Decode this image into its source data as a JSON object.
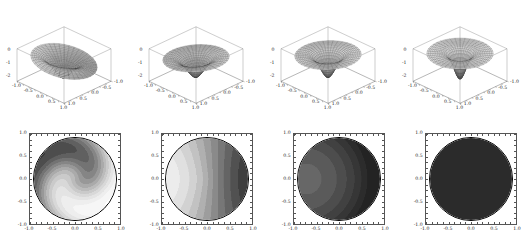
{
  "figure": {
    "background": "#ffffff",
    "rows": 2,
    "columns": 4
  },
  "axes": {
    "x_ticks": [
      "-1.0",
      "-0.5",
      "0.0",
      "0.5",
      "1.0"
    ],
    "y_ticks": [
      "1.0",
      "0.5",
      "0.0",
      "-0.5",
      "-1.0"
    ],
    "z_ticks": [
      "0",
      "-1",
      "-2"
    ],
    "x_range": [
      -1.0,
      1.0
    ],
    "y_range": [
      -1.0,
      1.0
    ],
    "z_range": [
      -2.0,
      0.0
    ]
  },
  "chart_data": [
    {
      "type": "heatmap",
      "panel": "surface-1",
      "row": "3d",
      "title": "",
      "xlabel": "",
      "ylabel": "",
      "zlabel": "",
      "xlim": [
        -1.0,
        1.0
      ],
      "ylim": [
        -1.0,
        1.0
      ],
      "zlim": [
        -2.0,
        0.0
      ],
      "x_ticks": [
        "-1.0",
        "-0.5",
        "0.0",
        "0.5",
        "1.0"
      ],
      "y_ticks": [
        "-1.0",
        "-0.5",
        "0.0",
        "0.5",
        "1.0"
      ],
      "z_ticks": [
        "0",
        "-1",
        "-2"
      ],
      "grid": true,
      "legend": "none",
      "shape": "twisted saddle with S-shaped ridge and valley, deep central depression",
      "radial_symmetry": false,
      "mesh": {
        "radial_lines": 36,
        "circular_lines": 20
      }
    },
    {
      "type": "heatmap",
      "panel": "surface-2",
      "row": "3d",
      "title": "",
      "xlabel": "",
      "ylabel": "",
      "zlabel": "",
      "xlim": [
        -1.0,
        1.0
      ],
      "ylim": [
        -1.0,
        1.0
      ],
      "zlim": [
        -2.0,
        0.0
      ],
      "x_ticks": [
        "-1.0",
        "-0.5",
        "0.0",
        "0.5",
        "1.0"
      ],
      "y_ticks": [
        "-1.0",
        "-0.5",
        "0.0",
        "0.5",
        "1.0"
      ],
      "z_ticks": [
        "0",
        "-1",
        "-2"
      ],
      "grid": true,
      "legend": "none",
      "shape": "shallow funnel with single off-centre cusp, mild azimuthal variation",
      "radial_symmetry": false,
      "mesh": {
        "radial_lines": 36,
        "circular_lines": 20
      }
    },
    {
      "type": "heatmap",
      "panel": "surface-3",
      "row": "3d",
      "title": "",
      "xlabel": "",
      "ylabel": "",
      "zlabel": "",
      "xlim": [
        -1.0,
        1.0
      ],
      "ylim": [
        -1.0,
        1.0
      ],
      "zlim": [
        -2.0,
        0.0
      ],
      "x_ticks": [
        "-1.0",
        "-0.5",
        "0.0",
        "0.5",
        "1.0"
      ],
      "y_ticks": [
        "-1.0",
        "-0.5",
        "0.0",
        "0.5",
        "1.0"
      ],
      "z_ticks": [
        "0",
        "-1",
        "-2"
      ],
      "grid": true,
      "legend": "none",
      "shape": "near radially symmetric flat disk with sharp central singular point",
      "radial_symmetry": true,
      "mesh": {
        "radial_lines": 36,
        "circular_lines": 20
      }
    },
    {
      "type": "heatmap",
      "panel": "surface-4",
      "row": "3d",
      "title": "",
      "xlabel": "",
      "ylabel": "",
      "zlabel": "",
      "xlim": [
        -1.0,
        1.0
      ],
      "ylim": [
        -1.0,
        1.0
      ],
      "zlim": [
        -2.0,
        0.0
      ],
      "x_ticks": [
        "-1.0",
        "-0.5",
        "0.0",
        "0.5",
        "1.0"
      ],
      "y_ticks": [
        "-1.0",
        "-0.5",
        "0.0",
        "0.5",
        "1.0"
      ],
      "z_ticks": [
        "0",
        "-1",
        "-2"
      ],
      "grid": true,
      "legend": "none",
      "shape": "flat radially symmetric disk with pronounced dark central spike",
      "radial_symmetry": true,
      "mesh": {
        "radial_lines": 36,
        "circular_lines": 20
      }
    },
    {
      "type": "heatmap",
      "panel": "contour-1",
      "row": "contour",
      "title": "",
      "xlabel": "",
      "ylabel": "",
      "xlim": [
        -1.0,
        1.0
      ],
      "ylim": [
        -1.0,
        1.0
      ],
      "x_ticks": [
        "-1.0",
        "-0.5",
        "0.0",
        "0.5",
        "1.0"
      ],
      "y_ticks": [
        "-1.0",
        "-0.5",
        "0.0",
        "0.5",
        "1.0"
      ],
      "grid": false,
      "legend": "none",
      "colormap": "grayscale",
      "contrast": "high",
      "pattern": "S-shaped bright band separating two dark lobes (upper-right and lower-left)",
      "levels": 14,
      "level_grays": [
        "#3a3a3a",
        "#4d4d4d",
        "#606060",
        "#737373",
        "#858585",
        "#989898",
        "#aaaaaa",
        "#bbbbbb",
        "#cacaca",
        "#d8d8d8",
        "#e4e4e4",
        "#eeeeee",
        "#f6f6f6",
        "#ffffff"
      ]
    },
    {
      "type": "heatmap",
      "panel": "contour-2",
      "row": "contour",
      "title": "",
      "xlabel": "",
      "ylabel": "",
      "xlim": [
        -1.0,
        1.0
      ],
      "ylim": [
        -1.0,
        1.0
      ],
      "x_ticks": [
        "-1.0",
        "-0.5",
        "0.0",
        "0.5",
        "1.0"
      ],
      "y_ticks": [
        "-1.0",
        "-0.5",
        "0.0",
        "0.5",
        "1.0"
      ],
      "grid": false,
      "legend": "none",
      "colormap": "grayscale",
      "contrast": "medium",
      "pattern": "left-to-right gradient, dark at left rim rising to white plateau right of centre",
      "levels": 14,
      "level_grays": [
        "#2e2e2e",
        "#3f3f3f",
        "#515151",
        "#646464",
        "#777777",
        "#8a8a8a",
        "#9d9d9d",
        "#b0b0b0",
        "#c2c2c2",
        "#d2d2d2",
        "#e0e0e0",
        "#ececec",
        "#f7f7f7",
        "#ffffff"
      ]
    },
    {
      "type": "heatmap",
      "panel": "contour-3",
      "row": "contour",
      "title": "",
      "xlabel": "",
      "ylabel": "",
      "xlim": [
        -1.0,
        1.0
      ],
      "ylim": [
        -1.0,
        1.0
      ],
      "x_ticks": [
        "-1.0",
        "-0.5",
        "0.0",
        "0.5",
        "1.0"
      ],
      "y_ticks": [
        "-1.0",
        "-0.5",
        "0.0",
        "0.5",
        "1.0"
      ],
      "grid": false,
      "legend": "none",
      "colormap": "grayscale",
      "contrast": "low",
      "pattern": "mostly dark disk with small light-gray elongated core right of centre",
      "levels": 12,
      "level_grays": [
        "#232323",
        "#2c2c2c",
        "#363636",
        "#414141",
        "#4d4d4d",
        "#5a5a5a",
        "#676767",
        "#757575",
        "#848484",
        "#959595",
        "#a6a6a6",
        "#b9b9b9"
      ]
    },
    {
      "type": "heatmap",
      "panel": "contour-4",
      "row": "contour",
      "title": "",
      "xlabel": "",
      "ylabel": "",
      "xlim": [
        -1.0,
        1.0
      ],
      "ylim": [
        -1.0,
        1.0
      ],
      "x_ticks": [
        "-1.0",
        "-0.5",
        "0.0",
        "0.5",
        "1.0"
      ],
      "y_ticks": [
        "-1.0",
        "-0.5",
        "0.0",
        "0.5",
        "1.0"
      ],
      "grid": false,
      "legend": "none",
      "colormap": "grayscale",
      "contrast": "none",
      "pattern": "essentially uniform dark disk, no visible internal contour structure",
      "levels": 2,
      "level_grays": [
        "#2b2b2b",
        "#2f2f2f"
      ]
    }
  ]
}
